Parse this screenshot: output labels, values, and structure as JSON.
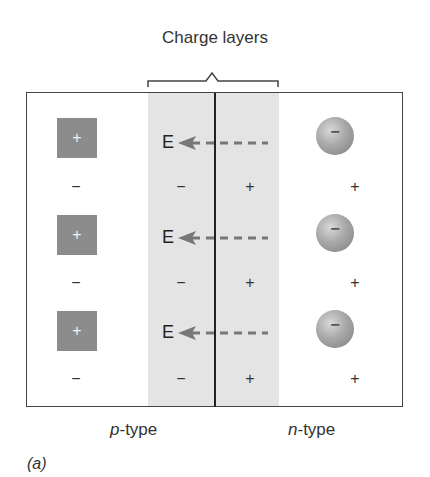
{
  "figure": {
    "title": "Charge layers",
    "caption": "(a)",
    "regions": {
      "left": {
        "prefix": "p",
        "suffix": "-type"
      },
      "right": {
        "prefix": "n",
        "suffix": "-type"
      }
    },
    "field_label": "E",
    "rows": [
      {
        "hole_symbol": "+",
        "field_label": "E",
        "electron_symbol": "−",
        "signs": [
          "−",
          "−",
          "+",
          "+"
        ]
      },
      {
        "hole_symbol": "+",
        "field_label": "E",
        "electron_symbol": "−",
        "signs": [
          "−",
          "−",
          "+",
          "+"
        ]
      },
      {
        "hole_symbol": "+",
        "field_label": "E",
        "electron_symbol": "−",
        "signs": [
          "−",
          "−",
          "+",
          "+"
        ]
      }
    ],
    "colors": {
      "depletion_band": "#e4e4e4",
      "hole_square": "#8c8c8c",
      "arrow": "#777777",
      "frame": "#444444"
    }
  }
}
